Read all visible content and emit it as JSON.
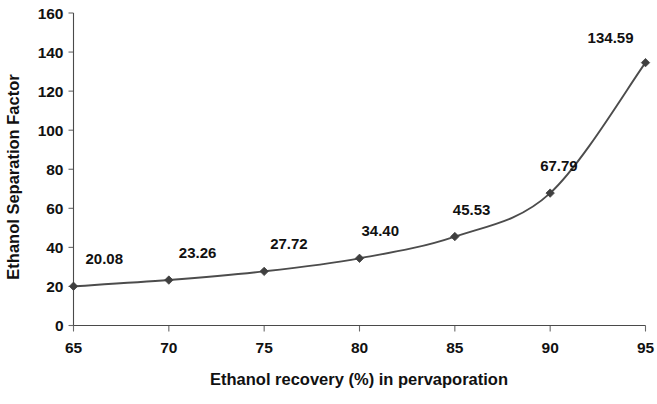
{
  "chart_data": {
    "type": "line",
    "title": "",
    "xlabel": "Ethanol recovery (%) in pervaporation",
    "ylabel": "Ethanol Separation Factor",
    "x": [
      65,
      70,
      75,
      80,
      85,
      90,
      95
    ],
    "values": [
      20.08,
      23.26,
      27.72,
      34.4,
      45.53,
      67.79,
      134.59
    ],
    "point_labels": [
      "20.08",
      "23.26",
      "27.72",
      "34.40",
      "45.53",
      "67.79",
      "134.59"
    ],
    "xlim": [
      65,
      95
    ],
    "ylim": [
      0,
      160
    ],
    "xticks": [
      65,
      70,
      75,
      80,
      85,
      90,
      95
    ],
    "xtick_labels": [
      "65",
      "70",
      "75",
      "80",
      "85",
      "90",
      "95"
    ],
    "yticks": [
      0,
      20,
      40,
      60,
      80,
      100,
      120,
      140,
      160
    ],
    "ytick_labels": [
      "0",
      "20",
      "40",
      "60",
      "80",
      "100",
      "120",
      "140",
      "160"
    ],
    "grid": false,
    "legend": "none",
    "marker": "diamond",
    "line_color": "#4c4c4c",
    "marker_color": "#3f3f3f",
    "text_color": "#111111",
    "background_color": "#ffffff"
  }
}
